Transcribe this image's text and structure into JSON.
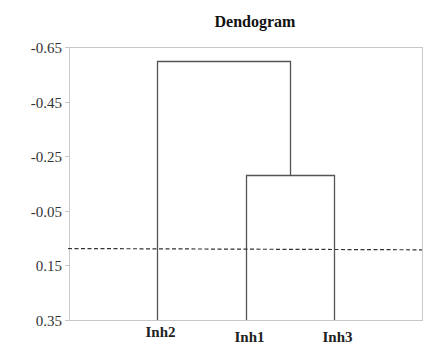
{
  "chart_data": {
    "type": "dendrogram",
    "title": "Dendogram",
    "xlabel": "",
    "ylabel": "",
    "categories": [
      "Inh2",
      "Inh1",
      "Inh3"
    ],
    "y_ticks": [
      "-0.65",
      "-0.45",
      "-0.25",
      "-0.05",
      "0.15",
      "0.35"
    ],
    "ylim": [
      -0.65,
      0.35
    ],
    "y_inverted": true,
    "grid": false,
    "legend": null,
    "merges": [
      {
        "left": "Inh1",
        "right": "Inh3",
        "height": -0.18
      },
      {
        "left": "Inh2",
        "right": "Inh1+Inh3",
        "height": -0.6
      }
    ],
    "leaf_baseline": 0.35,
    "cut_line": {
      "value": 0.09,
      "style": "dashed"
    },
    "colors": {
      "axis": "#c8c8c8",
      "links": "#555555",
      "cut_line": "#333333",
      "text": "#222222"
    }
  }
}
